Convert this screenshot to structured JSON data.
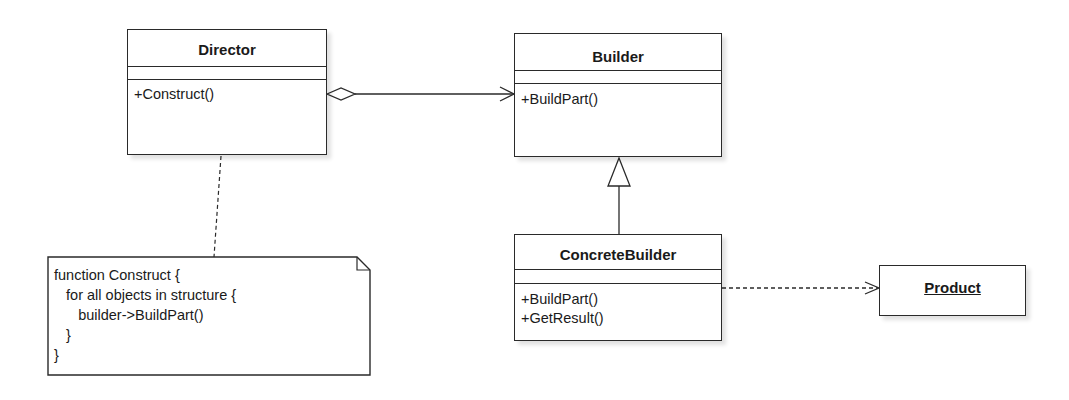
{
  "diagram": {
    "type": "UML class diagram",
    "classes": {
      "director": {
        "name": "Director",
        "attributes": [],
        "operations": [
          "+Construct()"
        ]
      },
      "builder": {
        "name": "Builder",
        "attributes": [],
        "operations": [
          "+BuildPart()"
        ]
      },
      "concrete_builder": {
        "name": "ConcreteBuilder",
        "attributes": [],
        "operations": [
          "+BuildPart()",
          "+GetResult()"
        ]
      },
      "product": {
        "name": "Product"
      }
    },
    "note": {
      "lines": [
        "function Construct {",
        "   for all objects in structure {",
        "      builder->BuildPart()",
        "   }",
        "}"
      ]
    },
    "relationships": [
      {
        "type": "aggregation",
        "from": "Director",
        "to": "Builder"
      },
      {
        "type": "generalization",
        "from": "ConcreteBuilder",
        "to": "Builder"
      },
      {
        "type": "dependency",
        "from": "ConcreteBuilder",
        "to": "Product"
      },
      {
        "type": "note-anchor",
        "from": "Note",
        "to": "Director"
      }
    ]
  }
}
